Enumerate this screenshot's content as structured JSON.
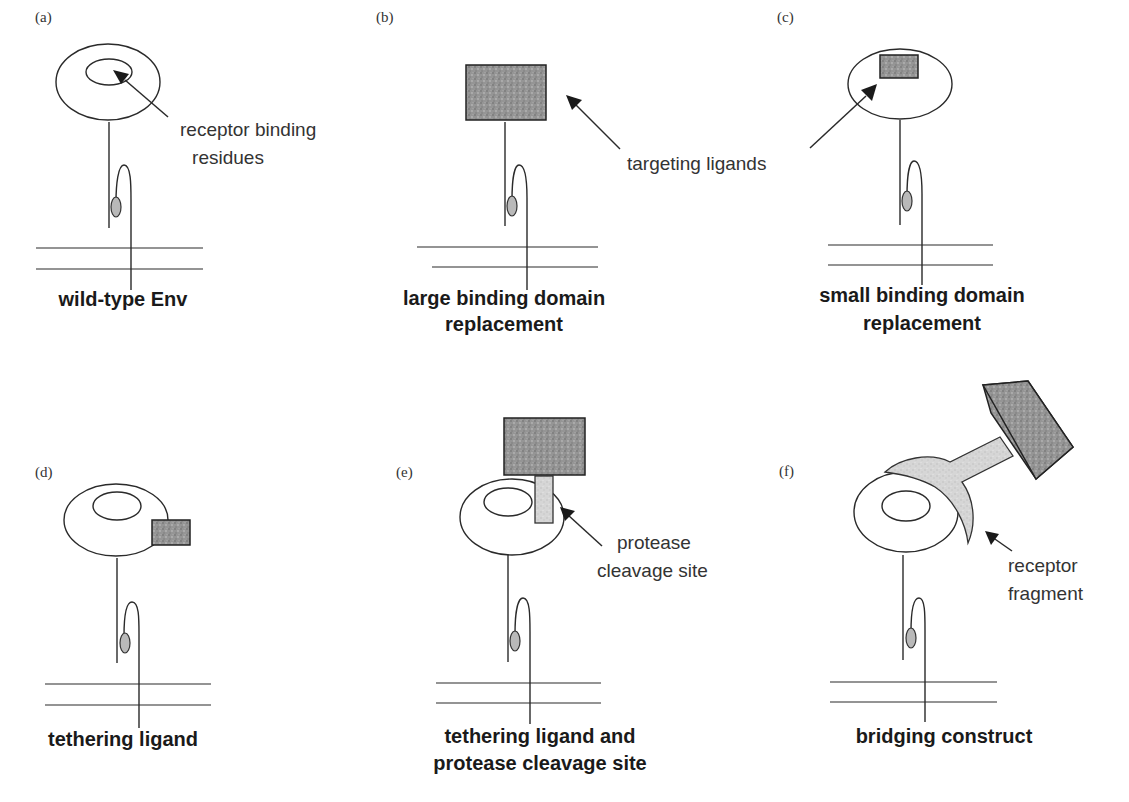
{
  "figure": {
    "panels": [
      {
        "id": "a",
        "label": "(a)",
        "caption": [
          "wild-type Env"
        ],
        "annotation": [
          "receptor binding",
          "residues"
        ]
      },
      {
        "id": "b",
        "label": "(b)",
        "caption": [
          "large binding domain",
          "replacement"
        ]
      },
      {
        "id": "c",
        "label": "(c)",
        "caption": [
          "small binding domain",
          "replacement"
        ]
      },
      {
        "id": "d",
        "label": "(d)",
        "caption": [
          "tethering ligand"
        ]
      },
      {
        "id": "e",
        "label": "(e)",
        "caption": [
          "tethering ligand and",
          "protease cleavage site"
        ],
        "annotation": [
          "protease",
          "cleavage site"
        ]
      },
      {
        "id": "f",
        "label": "(f)",
        "caption": [
          "bridging construct"
        ],
        "annotation": [
          "receptor",
          "fragment"
        ]
      }
    ],
    "shared_annotation": "targeting ligands",
    "colors": {
      "ink": "#2a2a2a",
      "ligand_fill": "#8a8a8a",
      "light_fill": "#d4d4d4",
      "oval_fill": "#b9b9b9"
    }
  }
}
